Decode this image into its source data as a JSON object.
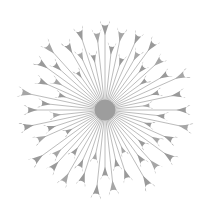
{
  "figure": {
    "type": "radial-node-link-diagram",
    "width": 211,
    "height": 219,
    "background_color": "#ffffff"
  },
  "style": {
    "node_color": "#9a9a9a",
    "node_color_light": "#a6a6a6",
    "edge_color": "#b4b4b4",
    "hub_color": "#9d9d9d",
    "edge_width": 0.9,
    "background_color": "#ffffff"
  },
  "chart_data": {
    "type": "scatter",
    "subtitle": "",
    "xlabel": "",
    "ylabel": "",
    "grid": false,
    "legend": "none",
    "xlim": [
      0,
      211
    ],
    "ylim": [
      0,
      219
    ],
    "hub": {
      "label": "center-hub",
      "cx": 105,
      "cy": 110,
      "radius": 10.5,
      "degree": 60
    },
    "leaf_count": 60,
    "angle_unit": "degrees",
    "radius_range": [
      44,
      96
    ],
    "leaves": [
      {
        "id": 1,
        "angle": 270.0,
        "radius": 92,
        "head": 5.0
      },
      {
        "id": 2,
        "angle": 276.0,
        "radius": 70,
        "head": 4.2
      },
      {
        "id": 3,
        "angle": 282.0,
        "radius": 86,
        "head": 4.8
      },
      {
        "id": 4,
        "angle": 288.0,
        "radius": 60,
        "head": 4.0
      },
      {
        "id": 5,
        "angle": 294.0,
        "radius": 88,
        "head": 4.6
      },
      {
        "id": 6,
        "angle": 300.0,
        "radius": 72,
        "head": 4.4
      },
      {
        "id": 7,
        "angle": 306.0,
        "radius": 90,
        "head": 5.0
      },
      {
        "id": 8,
        "angle": 312.0,
        "radius": 64,
        "head": 4.0
      },
      {
        "id": 9,
        "angle": 318.0,
        "radius": 82,
        "head": 4.6
      },
      {
        "id": 10,
        "angle": 324.0,
        "radius": 56,
        "head": 3.8
      },
      {
        "id": 11,
        "angle": 330.0,
        "radius": 78,
        "head": 4.4
      },
      {
        "id": 12,
        "angle": 336.0,
        "radius": 94,
        "head": 5.0
      },
      {
        "id": 13,
        "angle": 342.0,
        "radius": 62,
        "head": 4.0
      },
      {
        "id": 14,
        "angle": 348.0,
        "radius": 84,
        "head": 4.8
      },
      {
        "id": 15,
        "angle": 354.0,
        "radius": 50,
        "head": 3.6
      },
      {
        "id": 16,
        "angle": 0.0,
        "radius": 88,
        "head": 4.8
      },
      {
        "id": 17,
        "angle": 6.0,
        "radius": 66,
        "head": 4.2
      },
      {
        "id": 18,
        "angle": 12.0,
        "radius": 92,
        "head": 5.0
      },
      {
        "id": 19,
        "angle": 18.0,
        "radius": 54,
        "head": 3.8
      },
      {
        "id": 20,
        "angle": 24.0,
        "radius": 80,
        "head": 4.6
      },
      {
        "id": 21,
        "angle": 30.0,
        "radius": 68,
        "head": 4.2
      },
      {
        "id": 22,
        "angle": 36.0,
        "radius": 90,
        "head": 5.0
      },
      {
        "id": 23,
        "angle": 42.0,
        "radius": 58,
        "head": 4.0
      },
      {
        "id": 24,
        "angle": 48.0,
        "radius": 84,
        "head": 4.8
      },
      {
        "id": 25,
        "angle": 54.0,
        "radius": 70,
        "head": 4.4
      },
      {
        "id": 26,
        "angle": 60.0,
        "radius": 94,
        "head": 5.2
      },
      {
        "id": 27,
        "angle": 66.0,
        "radius": 52,
        "head": 3.6
      },
      {
        "id": 28,
        "angle": 72.0,
        "radius": 78,
        "head": 4.6
      },
      {
        "id": 29,
        "angle": 78.0,
        "radius": 64,
        "head": 4.2
      },
      {
        "id": 30,
        "angle": 84.0,
        "radius": 88,
        "head": 5.0
      },
      {
        "id": 31,
        "angle": 90.0,
        "radius": 72,
        "head": 4.4
      },
      {
        "id": 32,
        "angle": 96.0,
        "radius": 92,
        "head": 5.0
      },
      {
        "id": 33,
        "angle": 102.0,
        "radius": 56,
        "head": 3.8
      },
      {
        "id": 34,
        "angle": 108.0,
        "radius": 82,
        "head": 4.8
      },
      {
        "id": 35,
        "angle": 114.0,
        "radius": 68,
        "head": 4.2
      },
      {
        "id": 36,
        "angle": 120.0,
        "radius": 90,
        "head": 5.0
      },
      {
        "id": 37,
        "angle": 126.0,
        "radius": 60,
        "head": 4.0
      },
      {
        "id": 38,
        "angle": 132.0,
        "radius": 86,
        "head": 4.8
      },
      {
        "id": 39,
        "angle": 138.0,
        "radius": 74,
        "head": 4.4
      },
      {
        "id": 40,
        "angle": 144.0,
        "radius": 94,
        "head": 5.0
      },
      {
        "id": 41,
        "angle": 150.0,
        "radius": 50,
        "head": 3.6
      },
      {
        "id": 42,
        "angle": 156.0,
        "radius": 80,
        "head": 4.6
      },
      {
        "id": 43,
        "angle": 162.0,
        "radius": 66,
        "head": 4.2
      },
      {
        "id": 44,
        "angle": 168.0,
        "radius": 90,
        "head": 5.0
      },
      {
        "id": 45,
        "angle": 174.0,
        "radius": 58,
        "head": 4.0
      },
      {
        "id": 46,
        "angle": 180.0,
        "radius": 84,
        "head": 4.8
      },
      {
        "id": 47,
        "angle": 186.0,
        "radius": 70,
        "head": 4.4
      },
      {
        "id": 48,
        "angle": 192.0,
        "radius": 92,
        "head": 5.0
      },
      {
        "id": 49,
        "angle": 198.0,
        "radius": 54,
        "head": 3.8
      },
      {
        "id": 50,
        "angle": 204.0,
        "radius": 78,
        "head": 4.6
      },
      {
        "id": 51,
        "angle": 210.0,
        "radius": 64,
        "head": 4.2
      },
      {
        "id": 52,
        "angle": 216.0,
        "radius": 88,
        "head": 5.0
      },
      {
        "id": 53,
        "angle": 222.0,
        "radius": 74,
        "head": 4.4
      },
      {
        "id": 54,
        "angle": 228.0,
        "radius": 94,
        "head": 5.2
      },
      {
        "id": 55,
        "angle": 234.0,
        "radius": 52,
        "head": 3.6
      },
      {
        "id": 56,
        "angle": 240.0,
        "radius": 82,
        "head": 4.8
      },
      {
        "id": 57,
        "angle": 246.0,
        "radius": 68,
        "head": 4.2
      },
      {
        "id": 58,
        "angle": 252.0,
        "radius": 90,
        "head": 5.0
      },
      {
        "id": 59,
        "angle": 258.0,
        "radius": 62,
        "head": 4.0
      },
      {
        "id": 60,
        "angle": 264.0,
        "radius": 84,
        "head": 4.8
      }
    ]
  }
}
